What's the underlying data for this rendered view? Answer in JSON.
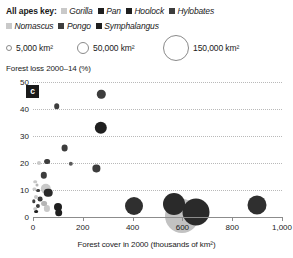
{
  "key": {
    "title": "All apes key:",
    "genera": [
      {
        "name": "Gorilla",
        "color": "#c9c9c9"
      },
      {
        "name": "Pan",
        "color": "#1f1f1f"
      },
      {
        "name": "Hoolock",
        "color": "#1f1f1f"
      },
      {
        "name": "Hylobates",
        "color": "#3d3d3d"
      },
      {
        "name": "Nomascus",
        "color": "#c9c9c9"
      },
      {
        "name": "Pongo",
        "color": "#3d3d3d"
      },
      {
        "name": "Symphalangus",
        "color": "#1f1f1f"
      }
    ]
  },
  "size_key": {
    "items": [
      {
        "label": "5,000 km²",
        "diameter_px": 4
      },
      {
        "label": "50,000 km²",
        "diameter_px": 10
      },
      {
        "label": "150,000 km²",
        "diameter_px": 22
      }
    ]
  },
  "panel": {
    "tag": "c"
  },
  "chart_data": {
    "type": "scatter",
    "title": "",
    "xlabel": "Forest cover in 2000 (thousands of km²)",
    "ylabel": "Forest loss 2000–14 (%)",
    "xlim": [
      0,
      1000
    ],
    "ylim": [
      0,
      50
    ],
    "xticks": [
      0,
      200,
      400,
      600,
      800,
      1000
    ],
    "xtick_labels": [
      "0",
      "200",
      "400",
      "600",
      "800",
      "1,000"
    ],
    "yticks": [
      0,
      10,
      20,
      30,
      40,
      50
    ],
    "ytick_labels": [
      "0",
      "10",
      "20",
      "30",
      "40",
      "50"
    ],
    "grid": "horizontal-dotted",
    "legend": "top",
    "size_encoding": "range area (km²)",
    "points": [
      {
        "genus": "Hylobates",
        "x": 274,
        "y": 45.5,
        "size": 14000,
        "color": "#3d3d3d",
        "r": 4.2
      },
      {
        "genus": "Hylobates",
        "x": 96,
        "y": 41.0,
        "size": 5000,
        "color": "#3d3d3d",
        "r": 2.8
      },
      {
        "genus": "Hoolock",
        "x": 272,
        "y": 33.0,
        "size": 30000,
        "color": "#1f1f1f",
        "r": 6.2
      },
      {
        "genus": "Hylobates",
        "x": 127,
        "y": 25.5,
        "size": 9000,
        "color": "#3d3d3d",
        "r": 3.4
      },
      {
        "genus": "Hylobates",
        "x": 57,
        "y": 20.5,
        "size": 6000,
        "color": "#3d3d3d",
        "r": 2.9
      },
      {
        "genus": "Nomascus",
        "x": 24,
        "y": 20.0,
        "size": 2500,
        "color": "#c9c9c9",
        "r": 2.0
      },
      {
        "genus": "Hylobates",
        "x": 152,
        "y": 19.6,
        "size": 3500,
        "color": "#5a5a5a",
        "r": 2.2
      },
      {
        "genus": "Hoolock",
        "x": 255,
        "y": 18.0,
        "size": 10000,
        "color": "#3d3d3d",
        "r": 3.6
      },
      {
        "genus": "Hylobates",
        "x": 43,
        "y": 15.5,
        "size": 8000,
        "color": "#3d3d3d",
        "r": 3.2
      },
      {
        "genus": "Nomascus",
        "x": 10,
        "y": 13.0,
        "size": 2000,
        "color": "#c9c9c9",
        "r": 1.8
      },
      {
        "genus": "Nomascus",
        "x": 16,
        "y": 12.0,
        "size": 1500,
        "color": "#b5b5b5",
        "r": 1.5
      },
      {
        "genus": "Gorilla",
        "x": 52,
        "y": 10.4,
        "size": 45000,
        "color": "#c9c9c9",
        "r": 5.2
      },
      {
        "genus": "Pan",
        "x": 61,
        "y": 9.0,
        "size": 30000,
        "color": "#2a2a2a",
        "r": 4.3
      },
      {
        "genus": "Nomascus",
        "x": 6,
        "y": 10.5,
        "size": 1500,
        "color": "#c9c9c9",
        "r": 1.6
      },
      {
        "genus": "Hylobates",
        "x": 21,
        "y": 9.8,
        "size": 2500,
        "color": "#3d3d3d",
        "r": 1.9
      },
      {
        "genus": "Nomascus",
        "x": 13,
        "y": 7.5,
        "size": 2500,
        "color": "#c9c9c9",
        "r": 2.0
      },
      {
        "genus": "Hylobates",
        "x": 30,
        "y": 6.5,
        "size": 4000,
        "color": "#3d3d3d",
        "r": 2.4
      },
      {
        "genus": "Nomascus",
        "x": 43,
        "y": 5.0,
        "size": 6000,
        "color": "#b5b5b5",
        "r": 2.9
      },
      {
        "genus": "Nomascus",
        "x": 55,
        "y": 3.2,
        "size": 7000,
        "color": "#c9c9c9",
        "r": 3.1
      },
      {
        "genus": "Hylobates",
        "x": 20,
        "y": 4.0,
        "size": 3000,
        "color": "#3d3d3d",
        "r": 2.1
      },
      {
        "genus": "Nomascus",
        "x": 8,
        "y": 3.0,
        "size": 2000,
        "color": "#c9c9c9",
        "r": 1.8
      },
      {
        "genus": "Symphalangus",
        "x": 12,
        "y": 2.0,
        "size": 2500,
        "color": "#1f1f1f",
        "r": 1.9
      },
      {
        "genus": "Hylobates",
        "x": 4,
        "y": 5.8,
        "size": 2000,
        "color": "#3d3d3d",
        "r": 1.7
      },
      {
        "genus": "Symphalangus",
        "x": 100,
        "y": 3.8,
        "size": 16000,
        "color": "#1f1f1f",
        "r": 4.0
      },
      {
        "genus": "Symphalangus",
        "x": 104,
        "y": 1.6,
        "size": 14000,
        "color": "#1f1f1f",
        "r": 3.8
      },
      {
        "genus": "Pongo",
        "x": 404,
        "y": 4.0,
        "size": 52000,
        "color": "#2f2f2f",
        "r": 9.0
      },
      {
        "genus": "Gorilla",
        "x": 600,
        "y": 0.5,
        "size": 150000,
        "color": "#c2c2c2",
        "r": 17.0
      },
      {
        "genus": "Pan",
        "x": 566,
        "y": 5.0,
        "size": 60000,
        "color": "#2a2a2a",
        "r": 11.0
      },
      {
        "genus": "Pan",
        "x": 656,
        "y": 2.0,
        "size": 85000,
        "color": "#2a2a2a",
        "r": 13.5
      },
      {
        "genus": "Pan",
        "x": 898,
        "y": 4.6,
        "size": 52000,
        "color": "#2f2f2f",
        "r": 9.5
      }
    ]
  }
}
